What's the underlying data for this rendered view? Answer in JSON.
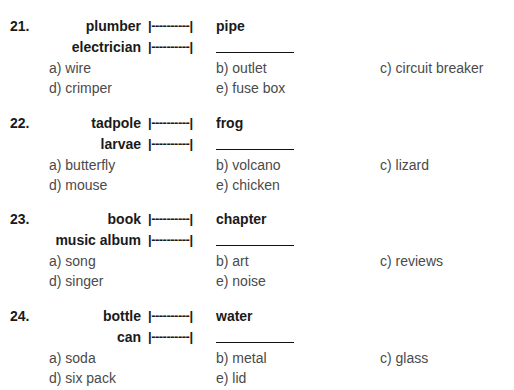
{
  "questions": [
    {
      "number": "21.",
      "pair": {
        "a": "plumber",
        "b": "pipe"
      },
      "query": {
        "a": "electrician"
      },
      "connector": "|----------|",
      "options": {
        "a": "a) wire",
        "b": "b) outlet",
        "c": "c) circuit breaker",
        "d": "d) crimper",
        "e": "e) fuse box"
      }
    },
    {
      "number": "22.",
      "pair": {
        "a": "tadpole",
        "b": "frog"
      },
      "query": {
        "a": "larvae"
      },
      "connector": "|----------|",
      "options": {
        "a": "a) butterfly",
        "b": "b) volcano",
        "c": "c) lizard",
        "d": "d) mouse",
        "e": "e) chicken"
      }
    },
    {
      "number": "23.",
      "pair": {
        "a": "book",
        "b": "chapter"
      },
      "query": {
        "a": "music album"
      },
      "connector": "|----------|",
      "options": {
        "a": "a) song",
        "b": "b) art",
        "c": "c) reviews",
        "d": "d) singer",
        "e": "e) noise"
      }
    },
    {
      "number": "24.",
      "pair": {
        "a": "bottle",
        "b": "water"
      },
      "query": {
        "a": "can"
      },
      "connector": "|----------|",
      "options": {
        "a": "a) soda",
        "b": "b) metal",
        "c": "c) glass",
        "d": "d) six pack",
        "e": "e) lid"
      }
    }
  ]
}
